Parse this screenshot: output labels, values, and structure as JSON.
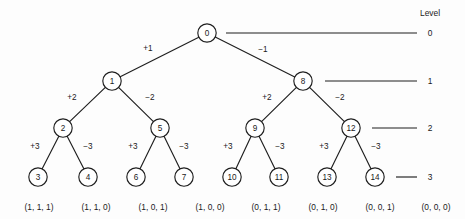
{
  "figure": {
    "background_color": "#fdfdfd",
    "stroke_color": "#1f1f1f",
    "text_color": "#1a1a1a"
  },
  "legend": {
    "heading": "Level",
    "levels": [
      {
        "label": "0",
        "y": 33,
        "line_x1": 226,
        "line_x2": 417,
        "text_x": 430
      },
      {
        "label": "1",
        "y": 81,
        "line_x1": 325,
        "line_x2": 417,
        "text_x": 430
      },
      {
        "label": "2",
        "y": 128,
        "line_x1": 372,
        "line_x2": 417,
        "text_x": 430
      },
      {
        "label": "3",
        "y": 177,
        "line_x1": 396,
        "line_x2": 417,
        "text_x": 430
      }
    ],
    "heading_x": 430,
    "heading_y": 13
  },
  "tree": {
    "node_radius": 9.2,
    "nodes": [
      {
        "id": "n0",
        "label": "0",
        "x": 207,
        "y": 33,
        "level": 0
      },
      {
        "id": "n1",
        "label": "1",
        "x": 112,
        "y": 81,
        "level": 1
      },
      {
        "id": "n8",
        "label": "8",
        "x": 303,
        "y": 81,
        "level": 1
      },
      {
        "id": "n2",
        "label": "2",
        "x": 63,
        "y": 128,
        "level": 2
      },
      {
        "id": "n5",
        "label": "5",
        "x": 160,
        "y": 128,
        "level": 2
      },
      {
        "id": "n9",
        "label": "9",
        "x": 255,
        "y": 128,
        "level": 2
      },
      {
        "id": "n12",
        "label": "12",
        "x": 351,
        "y": 128,
        "level": 2
      },
      {
        "id": "n3",
        "label": "3",
        "x": 38,
        "y": 177,
        "level": 3
      },
      {
        "id": "n4",
        "label": "4",
        "x": 88,
        "y": 177,
        "level": 3
      },
      {
        "id": "n6",
        "label": "6",
        "x": 136,
        "y": 177,
        "level": 3
      },
      {
        "id": "n7",
        "label": "7",
        "x": 184,
        "y": 177,
        "level": 3
      },
      {
        "id": "n10",
        "label": "10",
        "x": 232,
        "y": 177,
        "level": 3
      },
      {
        "id": "n11",
        "label": "11",
        "x": 279,
        "y": 177,
        "level": 3
      },
      {
        "id": "n13",
        "label": "13",
        "x": 327,
        "y": 177,
        "level": 3
      },
      {
        "id": "n14",
        "label": "14",
        "x": 375,
        "y": 177,
        "level": 3
      }
    ],
    "edges": [
      {
        "from": "n0",
        "to": "n1",
        "label": "+1",
        "label_x": 148,
        "label_y": 48
      },
      {
        "from": "n0",
        "to": "n8",
        "label": "−1",
        "label_x": 263,
        "label_y": 49
      },
      {
        "from": "n1",
        "to": "n2",
        "label": "+2",
        "label_x": 72,
        "label_y": 97
      },
      {
        "from": "n1",
        "to": "n5",
        "label": "−2",
        "label_x": 150,
        "label_y": 97
      },
      {
        "from": "n8",
        "to": "n9",
        "label": "+2",
        "label_x": 267,
        "label_y": 97
      },
      {
        "from": "n8",
        "to": "n12",
        "label": "−2",
        "label_x": 340,
        "label_y": 97
      },
      {
        "from": "n2",
        "to": "n3",
        "label": "+3",
        "label_x": 35,
        "label_y": 146
      },
      {
        "from": "n2",
        "to": "n4",
        "label": "−3",
        "label_x": 88,
        "label_y": 146
      },
      {
        "from": "n5",
        "to": "n6",
        "label": "+3",
        "label_x": 133,
        "label_y": 146
      },
      {
        "from": "n5",
        "to": "n7",
        "label": "−3",
        "label_x": 184,
        "label_y": 146
      },
      {
        "from": "n9",
        "to": "n10",
        "label": "+3",
        "label_x": 228,
        "label_y": 146
      },
      {
        "from": "n9",
        "to": "n11",
        "label": "−3",
        "label_x": 280,
        "label_y": 146
      },
      {
        "from": "n12",
        "to": "n13",
        "label": "+3",
        "label_x": 324,
        "label_y": 146
      },
      {
        "from": "n12",
        "to": "n14",
        "label": "−3",
        "label_x": 376,
        "label_y": 146
      }
    ],
    "leaf_tuples": [
      {
        "node": "n3",
        "text": "(1, 1, 1)",
        "x": 39,
        "y": 207
      },
      {
        "node": "n4",
        "text": "(1, 1, 0)",
        "x": 96,
        "y": 207
      },
      {
        "node": "n6",
        "text": "(1, 0, 1)",
        "x": 153,
        "y": 207
      },
      {
        "node": "n7",
        "text": "(1, 0, 0)",
        "x": 210,
        "y": 207
      },
      {
        "node": "n10",
        "text": "(0, 1, 1)",
        "x": 266,
        "y": 207
      },
      {
        "node": "n11",
        "text": "(0, 1, 0)",
        "x": 323,
        "y": 207
      },
      {
        "node": "n13",
        "text": "(0, 0, 1)",
        "x": 380,
        "y": 207
      },
      {
        "node": "n14",
        "text": "(0, 0, 0)",
        "x": 436,
        "y": 207
      }
    ]
  },
  "chart_data": {
    "type": "diagram",
    "levels": [
      "0",
      "1",
      "2",
      "3"
    ],
    "level_heading": "Level",
    "nodes": [
      "0",
      "1",
      "8",
      "2",
      "5",
      "9",
      "12",
      "3",
      "4",
      "6",
      "7",
      "10",
      "11",
      "13",
      "14"
    ],
    "edge_labels": [
      "+1",
      "−1",
      "+2",
      "−2",
      "+2",
      "−2",
      "+3",
      "−3",
      "+3",
      "−3",
      "+3",
      "−3",
      "+3",
      "−3"
    ],
    "leaf_codewords": [
      "(1, 1, 1)",
      "(1, 1, 0)",
      "(1, 0, 1)",
      "(1, 0, 0)",
      "(0, 1, 1)",
      "(0, 1, 0)",
      "(0, 0, 1)",
      "(0, 0, 0)"
    ]
  }
}
